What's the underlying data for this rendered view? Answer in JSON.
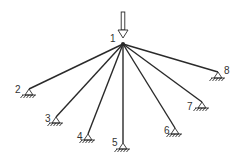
{
  "diagram": {
    "type": "truss-fan",
    "apex": {
      "id": "1",
      "x": 123,
      "y": 44,
      "label": "1",
      "label_x": 110,
      "label_y": 42
    },
    "load_arrow": {
      "x": 123,
      "y_top": 12,
      "y_tip": 38,
      "direction": "down"
    },
    "supports": [
      {
        "id": "2",
        "label": "2",
        "x": 29,
        "y": 95,
        "label_x": 15,
        "label_y": 93
      },
      {
        "id": "3",
        "label": "3",
        "x": 56,
        "y": 123,
        "label_x": 45,
        "label_y": 122
      },
      {
        "id": "4",
        "label": "4",
        "x": 88,
        "y": 140,
        "label_x": 77,
        "label_y": 140
      },
      {
        "id": "5",
        "label": "5",
        "x": 123,
        "y": 149,
        "label_x": 112,
        "label_y": 146
      },
      {
        "id": "6",
        "label": "6",
        "x": 175,
        "y": 134,
        "label_x": 164,
        "label_y": 134
      },
      {
        "id": "7",
        "label": "7",
        "x": 202,
        "y": 108,
        "label_x": 187,
        "label_y": 110
      },
      {
        "id": "8",
        "label": "8",
        "x": 218,
        "y": 78,
        "label_x": 224,
        "label_y": 74
      }
    ],
    "colors": {
      "line": "#2a2a2a",
      "label": "#333333",
      "background": "#ffffff"
    }
  }
}
